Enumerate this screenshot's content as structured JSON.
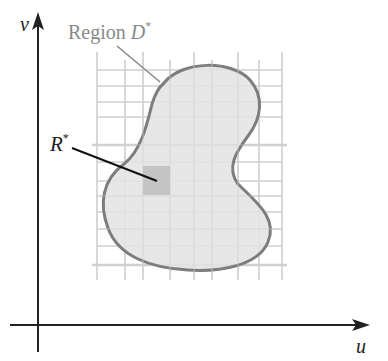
{
  "axes": {
    "x_label": "u",
    "y_label": "v"
  },
  "labels": {
    "region": {
      "prefix": "Region ",
      "symbol": "D",
      "superscript": "*"
    },
    "subrect": {
      "symbol": "R",
      "superscript": "*"
    }
  },
  "colors": {
    "axis": "#222222",
    "grid": "#cfcfcf",
    "region_fill": "#e4e4e4",
    "region_outline": "#7d7d7d",
    "subrect_fill": "#c4c4c4",
    "region_label": "#8a8a8a",
    "leader_line": "#8a8a8a",
    "r_leader_line": "#111111"
  },
  "grid": {
    "vertical_x": [
      97,
      125,
      143,
      170,
      194,
      212,
      238,
      259,
      282
    ],
    "horizontal_y": [
      70,
      86,
      102,
      117,
      145,
      162,
      181,
      196,
      212,
      229,
      246,
      265
    ],
    "x_range": [
      97,
      282
    ],
    "y_range": [
      52,
      280
    ]
  }
}
